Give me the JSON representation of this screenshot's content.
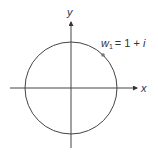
{
  "diagram": {
    "type": "complex-plane",
    "axes": {
      "x_label": "x",
      "y_label": "y"
    },
    "circle": {
      "center": [
        0,
        0
      ],
      "radius": "sqrt(2)"
    },
    "point": {
      "name": "w",
      "subscript": "1",
      "equals": "= 1 + ",
      "imag": "i",
      "label": "w1 = 1 + i"
    },
    "colors": {
      "stroke": "#444444",
      "point": "#777777",
      "text": "#333333"
    }
  }
}
